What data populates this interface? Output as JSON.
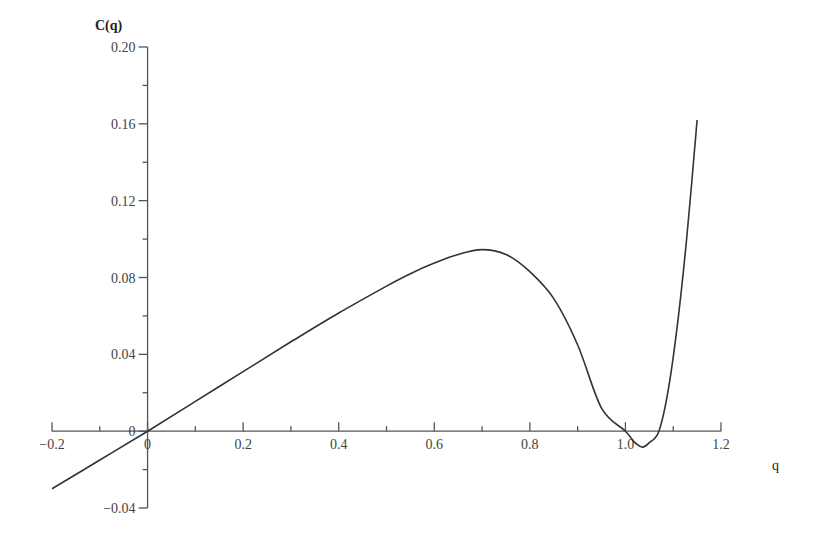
{
  "chart_data": {
    "type": "line",
    "title": "",
    "xlabel": "q",
    "ylabel": "C(q)",
    "xlim": [
      -0.2,
      1.2
    ],
    "ylim": [
      -0.04,
      0.2
    ],
    "grid": false,
    "legend": null,
    "x_ticks": [
      -0.2,
      0,
      0.2,
      0.4,
      0.6,
      0.8,
      1.0,
      1.2
    ],
    "x_tick_labels": [
      "-0.2",
      "0",
      "0.2",
      "0.4",
      "0.6",
      "0.8",
      "1.0",
      "1.2"
    ],
    "x_minor_ticks": [
      -0.1,
      0.1,
      0.3,
      0.5,
      0.7,
      0.9,
      1.1
    ],
    "y_ticks": [
      -0.04,
      0,
      0.04,
      0.08,
      0.12,
      0.16,
      0.2
    ],
    "y_tick_labels": [
      "-0.04",
      "0",
      "0.04",
      "0.08",
      "0.12",
      "0.16",
      "0.20"
    ],
    "y_minor_ticks": [
      -0.02,
      0.02,
      0.06,
      0.1,
      0.14,
      0.18
    ],
    "series": [
      {
        "name": "C(q)",
        "color": "#333333",
        "x": [
          -0.2,
          -0.1,
          0.0,
          0.1,
          0.2,
          0.3,
          0.4,
          0.5,
          0.55,
          0.6,
          0.65,
          0.7,
          0.75,
          0.8,
          0.85,
          0.9,
          0.95,
          1.0,
          1.02,
          1.036,
          1.05,
          1.07,
          1.09,
          1.11,
          1.13,
          1.15
        ],
        "y": [
          -0.03,
          -0.015,
          0.0,
          0.0155,
          0.031,
          0.0465,
          0.0615,
          0.0755,
          0.082,
          0.0875,
          0.092,
          0.0945,
          0.092,
          0.083,
          0.069,
          0.045,
          0.012,
          0.0,
          -0.006,
          -0.0083,
          -0.006,
          0.0,
          0.022,
          0.058,
          0.105,
          0.162
        ]
      }
    ],
    "annotations": [
      "0 label at origin on both axes"
    ]
  }
}
